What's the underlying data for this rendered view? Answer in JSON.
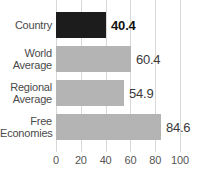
{
  "chart_data": {
    "type": "bar",
    "orientation": "horizontal",
    "title": "",
    "xlabel": "",
    "ylabel": "",
    "xlim": [
      0,
      100
    ],
    "xticks": [
      "0",
      "20",
      "40",
      "60",
      "80",
      "100"
    ],
    "grid": true,
    "legend": "none",
    "categories": [
      "Country",
      "World Average",
      "Regional Average",
      "Free Economies"
    ],
    "values": [
      40.4,
      60.4,
      54.9,
      84.6
    ],
    "value_labels": [
      "40.4",
      "60.4",
      "54.9",
      "84.6"
    ],
    "bars": [
      {
        "category_lines": [
          "Country"
        ],
        "value": 40.4,
        "value_label": "40.4",
        "color": "#1c1c1c",
        "label_style": "bold"
      },
      {
        "category_lines": [
          "World",
          "Average"
        ],
        "value": 60.4,
        "value_label": "60.4",
        "color": "#b4b4b4",
        "label_style": "normal"
      },
      {
        "category_lines": [
          "Regional",
          "Average"
        ],
        "value": 54.9,
        "value_label": "54.9",
        "color": "#b4b4b4",
        "label_style": "normal"
      },
      {
        "category_lines": [
          "Free",
          "Economies"
        ],
        "value": 84.6,
        "value_label": "84.6",
        "color": "#b4b4b4",
        "label_style": "normal"
      }
    ],
    "colors": {
      "highlight_bar": "#1c1c1c",
      "reference_bar": "#b4b4b4",
      "gridline": "#d8d8d8",
      "tick_text": "#555555",
      "category_text": "#4a4a4a",
      "value_text": "#3a3a3a",
      "background": "#ffffff"
    }
  }
}
